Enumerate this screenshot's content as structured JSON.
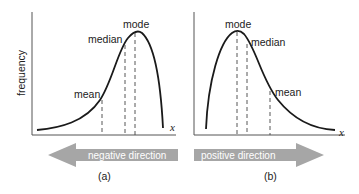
{
  "panel_a": {
    "caption": "(a)",
    "y_axis_label": "frequency",
    "x_axis_label": "x",
    "labels": {
      "mean": "mean",
      "median": "median",
      "mode": "mode"
    },
    "arrow": {
      "label": "negative direction",
      "direction": "left"
    }
  },
  "panel_b": {
    "caption": "(b)",
    "x_axis_label": "x",
    "labels": {
      "mode": "mode",
      "median": "median",
      "mean": "mean"
    },
    "arrow": {
      "label": "positive direction",
      "direction": "right"
    }
  },
  "colors": {
    "curve": "#1a1a1a",
    "axis": "#555555",
    "arrow": "#a6a6a6",
    "text": "#222222"
  }
}
